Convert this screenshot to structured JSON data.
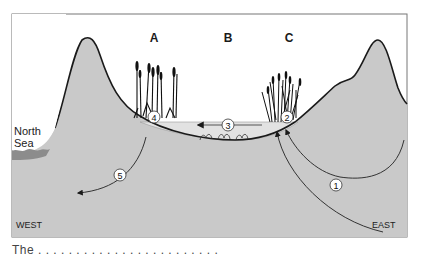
{
  "diagram": {
    "zones": [
      {
        "id": "A",
        "label": "A",
        "x": 154,
        "y": 31
      },
      {
        "id": "B",
        "label": "B",
        "x": 228,
        "y": 31
      },
      {
        "id": "C",
        "label": "C",
        "x": 289,
        "y": 31
      }
    ],
    "sea_label": {
      "line1": "North",
      "line2": "Sea"
    },
    "directions": {
      "west": "WEST",
      "east": "EAST"
    },
    "markers": [
      {
        "num": "1",
        "label": "①",
        "x": 336,
        "y": 185
      },
      {
        "num": "2",
        "label": "②",
        "x": 287,
        "y": 117
      },
      {
        "num": "3",
        "label": "③",
        "x": 228,
        "y": 125
      },
      {
        "num": "4",
        "label": "④",
        "x": 154,
        "y": 117
      },
      {
        "num": "5",
        "label": "⑤",
        "x": 120,
        "y": 175
      }
    ],
    "colors": {
      "ground": "#c9c9c9",
      "outline": "#1a1a1a",
      "water": "#e2e2e2",
      "sea": "#8c8c8c",
      "frame": "#777777"
    }
  },
  "caption": "The . . . . . . . . . . . . . . . . . . . . . . . ."
}
